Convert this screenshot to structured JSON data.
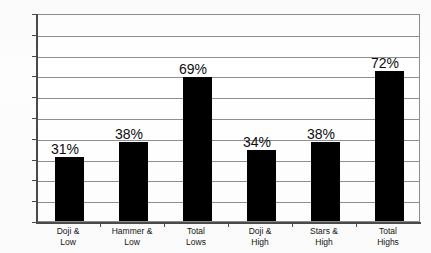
{
  "chart_data": {
    "type": "bar",
    "title": "",
    "subtitle": "",
    "xlabel": "",
    "ylabel": "",
    "ylim": [
      0,
      100
    ],
    "y_unit": "%",
    "grid": true,
    "legend": "none",
    "orientation": "vertical",
    "bar_color": "#000000",
    "gridline_color": "#8f8f8f",
    "axis_color": "#4a4a4a",
    "background_color": "#ffffff",
    "categories": [
      "Doji & Low",
      "Hammer & Low",
      "Total Lows",
      "Doji & High",
      "Stars & High",
      "Total Highs"
    ],
    "category_lines": [
      {
        "line1": "Doji &",
        "line2": "Low"
      },
      {
        "line1": "Hammer &",
        "line2": "Low"
      },
      {
        "line1": "Total",
        "line2": "Lows"
      },
      {
        "line1": "Doji &",
        "line2": "High"
      },
      {
        "line1": "Stars &",
        "line2": "High"
      },
      {
        "line1": "Total",
        "line2": "Highs"
      }
    ],
    "values": [
      31,
      38,
      69,
      34,
      38,
      72
    ],
    "data_labels": [
      "31%",
      "38%",
      "69%",
      "34%",
      "38%",
      "72%"
    ],
    "yticks": [
      0,
      10,
      20,
      30,
      40,
      50,
      60,
      70,
      80,
      90,
      100
    ],
    "ytick_labels": [
      "0%",
      "10%",
      "20%",
      "30%",
      "40%",
      "50%",
      "60%",
      "70%",
      "80%",
      "90%",
      "100%"
    ]
  }
}
